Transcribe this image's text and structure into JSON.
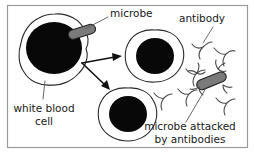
{
  "figure": {
    "frame_color": "#9a9a9a",
    "background_color": "#ffffff",
    "labels": {
      "microbe": "microbe",
      "antibody": "antibody",
      "white_blood_cell_line1": "white blood",
      "white_blood_cell_line2": "cell",
      "microbe_attacked_line1": "microbe attacked",
      "microbe_attacked_line2": "by antibodies"
    },
    "colors": {
      "nucleus": "#080808",
      "membrane_stroke": "#2a2a2a",
      "microbe_fill": "#7a7a7a",
      "microbe_stroke": "#242424",
      "antibody_stroke": "#4a4a4a",
      "arrow": "#111111",
      "leader": "#5a5a5a",
      "text": "#1a1a1a"
    },
    "elements": [
      {
        "name": "white-blood-cell-large",
        "kind": "cell",
        "cx": 55,
        "cy": 52
      },
      {
        "name": "white-blood-cell-upper-right",
        "kind": "cell",
        "cx": 155,
        "cy": 57
      },
      {
        "name": "white-blood-cell-lower-middle",
        "kind": "cell",
        "cx": 128,
        "cy": 115
      },
      {
        "name": "microbe-free",
        "kind": "microbe",
        "cx": 82,
        "cy": 33
      },
      {
        "name": "microbe-attacked",
        "kind": "microbe",
        "cx": 211,
        "cy": 81
      },
      {
        "name": "antibody-1",
        "kind": "antibody",
        "cx": 198,
        "cy": 50
      },
      {
        "name": "antibody-2",
        "kind": "antibody",
        "cx": 222,
        "cy": 57
      },
      {
        "name": "antibody-3",
        "kind": "antibody",
        "cx": 193,
        "cy": 75
      },
      {
        "name": "antibody-4",
        "kind": "antibody",
        "cx": 160,
        "cy": 100
      },
      {
        "name": "antibody-5",
        "kind": "antibody",
        "cx": 185,
        "cy": 96
      },
      {
        "name": "antibody-6",
        "kind": "antibody",
        "cx": 223,
        "cy": 104
      }
    ],
    "arrows": [
      {
        "name": "arrow-to-upper-cell",
        "from": [
          82,
          62
        ],
        "to": [
          121,
          58
        ]
      },
      {
        "name": "arrow-to-lower-cell",
        "from": [
          82,
          62
        ],
        "to": [
          109,
          89
        ]
      }
    ]
  }
}
